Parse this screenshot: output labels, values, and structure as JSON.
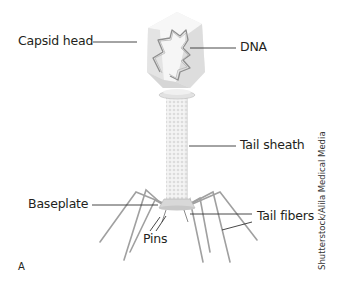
{
  "figure": {
    "panel_letter": "A",
    "credit": "Shutterstock/Alila Medical Media",
    "labels": {
      "capsid_head": "Capsid head",
      "dna": "DNA",
      "tail_sheath": "Tail sheath",
      "baseplate": "Baseplate",
      "pins": "Pins",
      "tail_fibers": "Tail fibers"
    },
    "colors": {
      "capsid_light": "#f2f2f2",
      "capsid_mid": "#e0e0e0",
      "capsid_dark": "#cfcfcf",
      "dna_stroke": "#8a8a8a",
      "tail_fill": "#ececec",
      "fiber_stroke": "#9a9a9a",
      "leader_line": "#333333"
    }
  }
}
